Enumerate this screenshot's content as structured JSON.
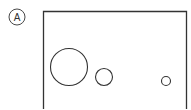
{
  "figure": {
    "label": "A",
    "stroke_color": "#333333",
    "background": "#ffffff",
    "label_marker": {
      "cx": 17,
      "cy": 17,
      "r": 8
    },
    "frame": {
      "x": 43.5,
      "y": 11.5,
      "width": 143,
      "height": 110,
      "open_bottom": true
    },
    "circles": [
      {
        "name": "large-circle",
        "cx": 69,
        "cy": 67,
        "r": 18.5
      },
      {
        "name": "medium-circle",
        "cx": 104,
        "cy": 77,
        "r": 8.5
      },
      {
        "name": "small-circle",
        "cx": 166,
        "cy": 81,
        "r": 4.5
      }
    ]
  }
}
